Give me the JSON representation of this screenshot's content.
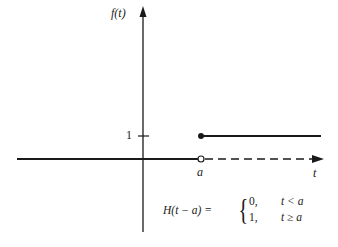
{
  "diagram": {
    "y_axis_label": "f(t)",
    "x_axis_label": "t",
    "y_tick_label": "1",
    "x_point_label": "a",
    "formula": {
      "lhs": "H(t − a) =",
      "cases": [
        {
          "value": "0,",
          "condition": "t < a"
        },
        {
          "value": "1,",
          "condition": "t ≥ a"
        }
      ]
    },
    "colors": {
      "line": "#1a1a1a",
      "background": "#ffffff"
    }
  }
}
